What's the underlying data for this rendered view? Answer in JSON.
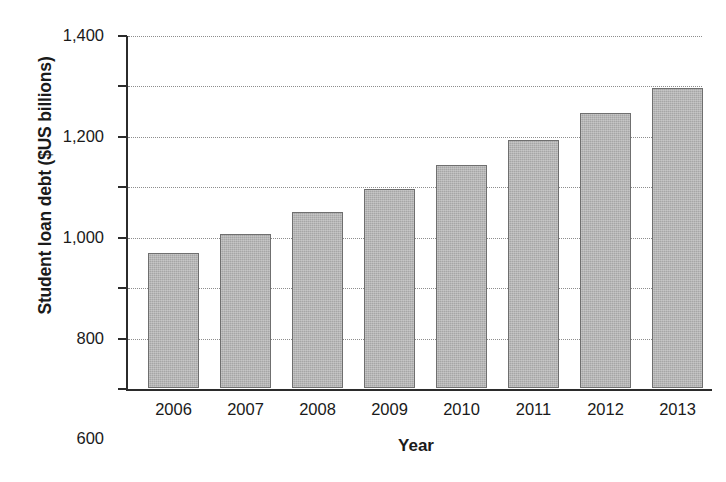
{
  "chart_data": {
    "type": "bar",
    "title": "",
    "xlabel": "Year",
    "ylabel": "Student loan debt ($US billions)",
    "categories": [
      "2006",
      "2007",
      "2008",
      "2009",
      "2010",
      "2011",
      "2012",
      "2013"
    ],
    "values": [
      535,
      610,
      700,
      790,
      885,
      985,
      1090,
      1190
    ],
    "ylim": [
      0,
      1400
    ],
    "yticks": [
      0,
      200,
      400,
      600,
      800,
      1000,
      1200,
      1400
    ],
    "ytick_labels": [
      "0",
      "200",
      "400",
      "600",
      "800",
      "1,000",
      "1,200",
      "1,400"
    ],
    "grid": true,
    "grid_axis": "y",
    "grid_style": "dotted",
    "legend": false,
    "bar_color": "#a6a6a6",
    "bar_edge_color": "#6f6f6f",
    "axis_color": "#2b2b2b",
    "series": [
      {
        "name": "Student loan debt",
        "values": [
          535,
          610,
          700,
          790,
          885,
          985,
          1090,
          1190
        ]
      }
    ]
  },
  "axes": {
    "y_title": "Student loan debt ($US billions)",
    "x_title": "Year"
  }
}
